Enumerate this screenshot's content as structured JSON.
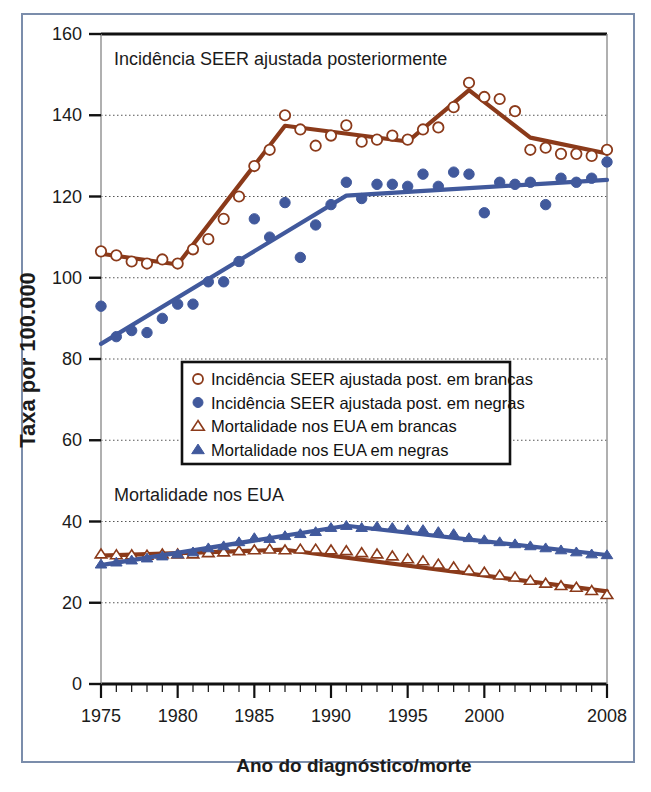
{
  "figure": {
    "border_color": "#7b8dab",
    "background": "#ffffff"
  },
  "colors": {
    "white_race_series": "#8B3A1A",
    "black_race_series": "#41599C",
    "axis": "#111111",
    "gridline": "#555555"
  },
  "chart_data": {
    "type": "line",
    "title": "",
    "xlabel": "Ano do diagnóstico/morte",
    "ylabel": "Taxa por 100.000",
    "xlim": [
      1975,
      2008
    ],
    "ylim": [
      0,
      160
    ],
    "xticks": [
      1975,
      1980,
      1985,
      1990,
      1995,
      2000,
      2008
    ],
    "xticklabels": [
      "1975",
      "1980",
      "1985",
      "1990",
      "1995",
      "2000",
      "2008"
    ],
    "yticks": [
      0,
      20,
      40,
      60,
      80,
      100,
      120,
      140,
      160
    ],
    "yticklabels": [
      "0",
      "20",
      "40",
      "60",
      "80",
      "100",
      "120",
      "140",
      "160"
    ],
    "grid": true,
    "grid_axis": "y",
    "legend_position": "center-left-middle",
    "annotations": [
      {
        "text": "Incidência SEER ajustada posteriormente",
        "x": 1977.5,
        "y": 152
      },
      {
        "text": "Mortalidade nos EUA",
        "x": 1977.5,
        "y": 47
      }
    ],
    "x": [
      1975,
      1976,
      1977,
      1978,
      1979,
      1980,
      1981,
      1982,
      1983,
      1984,
      1985,
      1986,
      1987,
      1988,
      1989,
      1990,
      1991,
      1992,
      1993,
      1994,
      1995,
      1996,
      1997,
      1998,
      1999,
      2000,
      2001,
      2002,
      2003,
      2004,
      2005,
      2006,
      2007,
      2008
    ],
    "series": [
      {
        "name": "Incidência SEER ajustada post. em brancas",
        "marker": "open-circle",
        "color": "#8B3A1A",
        "values": [
          106.5,
          105.5,
          104.0,
          103.5,
          104.5,
          103.5,
          107.0,
          109.5,
          114.5,
          120.0,
          127.5,
          131.5,
          140.0,
          136.5,
          132.5,
          135.0,
          137.5,
          133.5,
          134.0,
          135.0,
          134.0,
          136.5,
          137.0,
          142.0,
          148.0,
          144.5,
          144.0,
          141.0,
          131.5,
          132.0,
          130.5,
          130.5,
          130.0,
          131.5
        ]
      },
      {
        "name": "Incidência SEER ajustada post. em negras",
        "marker": "filled-circle",
        "color": "#41599C",
        "values": [
          93.0,
          85.5,
          87.0,
          86.5,
          90.0,
          93.5,
          93.5,
          99.0,
          99.0,
          104.0,
          114.5,
          110.0,
          118.5,
          105.0,
          113.0,
          118.0,
          123.5,
          119.5,
          123.0,
          123.0,
          122.5,
          125.5,
          122.5,
          126.0,
          125.5,
          116.0,
          123.5,
          123.0,
          123.5,
          118.0,
          124.5,
          123.5,
          124.5,
          128.5
        ]
      },
      {
        "name": "Mortalidade nos EUA em brancas",
        "marker": "open-triangle",
        "color": "#8B3A1A",
        "values": [
          32.0,
          31.8,
          31.8,
          31.7,
          32.0,
          32.0,
          32.0,
          32.3,
          32.5,
          32.8,
          33.0,
          33.2,
          33.0,
          33.2,
          33.2,
          33.0,
          32.8,
          32.3,
          32.0,
          31.5,
          30.8,
          30.3,
          29.5,
          28.8,
          28.0,
          27.5,
          26.8,
          26.3,
          25.5,
          24.8,
          24.2,
          23.8,
          23.0,
          22.0
        ]
      },
      {
        "name": "Mortalidade nos EUA em negras",
        "marker": "filled-triangle",
        "color": "#41599C",
        "values": [
          29.5,
          30.0,
          30.5,
          31.0,
          31.5,
          32.0,
          32.5,
          33.5,
          34.0,
          35.0,
          36.0,
          35.8,
          36.5,
          37.0,
          37.5,
          38.5,
          39.0,
          38.5,
          38.8,
          38.5,
          38.0,
          38.0,
          37.5,
          37.0,
          36.0,
          35.5,
          35.0,
          34.5,
          34.0,
          33.5,
          33.0,
          32.5,
          32.0,
          31.8
        ]
      }
    ]
  },
  "legend": {
    "items": [
      {
        "label": "Incidência SEER ajustada post. em brancas",
        "marker": "open-circle",
        "color": "#8B3A1A"
      },
      {
        "label": "Incidência SEER ajustada post. em negras",
        "marker": "filled-circle",
        "color": "#41599C"
      },
      {
        "label": "Mortalidade nos EUA em brancas",
        "marker": "open-triangle",
        "color": "#8B3A1A"
      },
      {
        "label": "Mortalidade nos EUA em negras",
        "marker": "filled-triangle",
        "color": "#41599C"
      }
    ]
  }
}
